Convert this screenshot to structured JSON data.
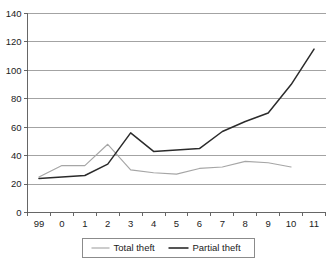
{
  "chart_data": {
    "type": "line",
    "title": "",
    "xlabel": "",
    "ylabel": "",
    "categories": [
      "99",
      "0",
      "1",
      "2",
      "3",
      "4",
      "5",
      "6",
      "7",
      "8",
      "9",
      "10",
      "11"
    ],
    "ylim": [
      0,
      140
    ],
    "ytick_labels": [
      "0",
      "20",
      "40",
      "60",
      "80",
      "100",
      "120",
      "140"
    ],
    "ytick_values": [
      0,
      20,
      40,
      60,
      80,
      100,
      120,
      140
    ],
    "grid": true,
    "grid_axis": "y",
    "legend_position": "bottom",
    "series": [
      {
        "name": "Total theft",
        "color": "#a6a6a6",
        "values": [
          25,
          33,
          33,
          48,
          30,
          28,
          27,
          31,
          32,
          36,
          35,
          32,
          null
        ]
      },
      {
        "name": "Partial theft",
        "color": "#2b2b2b",
        "values": [
          24,
          25,
          26,
          34,
          56,
          43,
          44,
          45,
          57,
          64,
          70,
          90,
          115
        ]
      }
    ]
  },
  "legend": {
    "entries": [
      {
        "label": "Total theft"
      },
      {
        "label": "Partial theft"
      }
    ]
  }
}
